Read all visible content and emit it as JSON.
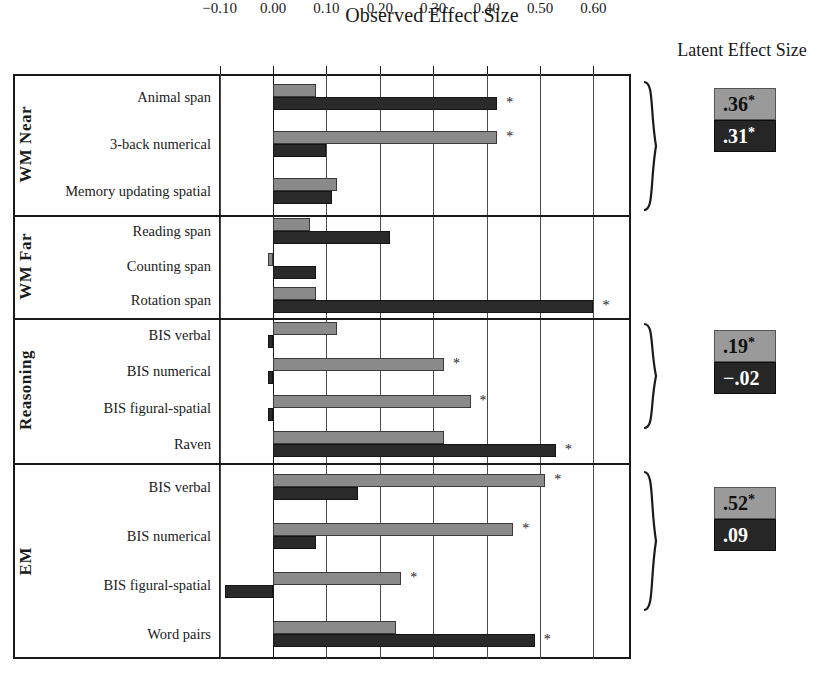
{
  "titles": {
    "observed": "Observed Effect Size",
    "latent": "Latent Effect Size"
  },
  "axis": {
    "ticks": [
      "-0.10",
      "0.00",
      "0.10",
      "0.20",
      "0.30",
      "0.40",
      "0.50",
      "0.60"
    ],
    "tick_values": [
      -0.1,
      0.0,
      0.1,
      0.2,
      0.3,
      0.4,
      0.5,
      0.6
    ]
  },
  "groups": [
    {
      "name": "WM Near",
      "rows": [
        "Animal span",
        "3-back numerical",
        "Memory updating spatial"
      ]
    },
    {
      "name": "WM Far",
      "rows": [
        "Reading span",
        "Counting span",
        "Rotation span"
      ]
    },
    {
      "name": "Reasoning",
      "rows": [
        "BIS verbal",
        "BIS numerical",
        "BIS figural-spatial",
        "Raven"
      ]
    },
    {
      "name": "EM",
      "rows": [
        "BIS verbal",
        "BIS numerical",
        "BIS figural-spatial",
        "Word pairs"
      ]
    }
  ],
  "latent": [
    {
      "group": "WM Near",
      "gray": ".36",
      "gray_star": "*",
      "dark": ".31",
      "dark_star": "*"
    },
    {
      "group": "Reasoning",
      "gray": ".19",
      "gray_star": "*",
      "dark": "-.02",
      "dark_star": ""
    },
    {
      "group": "EM",
      "gray": ".52",
      "gray_star": "*",
      "dark": ".09",
      "dark_star": ""
    }
  ],
  "colors": {
    "gray_series": "#8a8a8a",
    "dark_series": "#2a2a2a",
    "frame": "#1a1a1a",
    "gridline": "#4a4a4a"
  },
  "chart_data": {
    "type": "bar",
    "title": "Observed Effect Size",
    "xlabel": "Observed Effect Size",
    "ylabel": "",
    "xlim": [
      -0.125,
      0.645
    ],
    "grid": true,
    "orientation": "horizontal",
    "legend": "none",
    "significance_marker": "*",
    "categories": [
      "WM Near: Animal span",
      "WM Near: 3-back numerical",
      "WM Near: Memory updating spatial",
      "WM Far: Reading span",
      "WM Far: Counting span",
      "WM Far: Rotation span",
      "Reasoning: BIS verbal",
      "Reasoning: BIS numerical",
      "Reasoning: BIS figural-spatial",
      "Reasoning: Raven",
      "EM: BIS verbal",
      "EM: BIS numerical",
      "EM: BIS figural-spatial",
      "EM: Word pairs"
    ],
    "series": [
      {
        "name": "gray",
        "values": [
          0.08,
          0.42,
          0.12,
          0.07,
          -0.01,
          0.08,
          0.12,
          0.32,
          0.37,
          0.32,
          0.51,
          0.45,
          0.24,
          0.23
        ],
        "significant": [
          false,
          true,
          false,
          false,
          false,
          false,
          false,
          true,
          true,
          false,
          true,
          true,
          true,
          false
        ]
      },
      {
        "name": "dark",
        "values": [
          0.42,
          0.1,
          0.11,
          0.22,
          0.08,
          0.6,
          -0.01,
          -0.01,
          -0.01,
          0.53,
          0.16,
          0.08,
          -0.09,
          0.49
        ],
        "significant": [
          true,
          false,
          false,
          false,
          false,
          true,
          false,
          false,
          false,
          true,
          false,
          false,
          false,
          true
        ]
      }
    ],
    "latent_effect_sizes": [
      {
        "group": "WM Near",
        "gray": 0.36,
        "gray_significant": true,
        "dark": 0.31,
        "dark_significant": true
      },
      {
        "group": "Reasoning",
        "gray": 0.19,
        "gray_significant": true,
        "dark": -0.02,
        "dark_significant": false
      },
      {
        "group": "EM",
        "gray": 0.52,
        "gray_significant": true,
        "dark": 0.09,
        "dark_significant": false
      }
    ]
  }
}
